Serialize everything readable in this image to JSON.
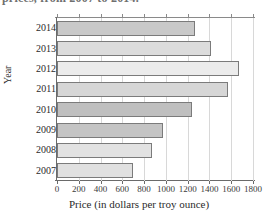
{
  "title": "prices, from 2007 to 2014.",
  "chart_data": {
    "type": "bar",
    "orientation": "horizontal",
    "title": "prices, from 2007 to 2014.",
    "xlabel": "Price (in dollars per troy ounce)",
    "ylabel": "Year",
    "categories": [
      "2014",
      "2013",
      "2012",
      "2011",
      "2010",
      "2009",
      "2008",
      "2007"
    ],
    "values": [
      1270,
      1410,
      1670,
      1570,
      1240,
      970,
      870,
      700
    ],
    "xlim": [
      0,
      1800
    ],
    "xticks": [
      0,
      200,
      400,
      600,
      800,
      1000,
      1200,
      1400,
      1600,
      1800
    ],
    "xtick_labels": [
      "0",
      "200",
      "400",
      "600",
      "800",
      "1000",
      "1200",
      "1400",
      "1600",
      "1800"
    ],
    "grid": true,
    "legend": "none",
    "bar_fills": [
      "#c9c9c9",
      "#dcdcdc",
      "#ececec",
      "#d6d6d6",
      "#bfbfbf",
      "#c4c4c4",
      "#e2e2e2",
      "#e0e0e0"
    ],
    "bar_edge_color": "#7b7b7b",
    "gridline_color": "#d8d8d8",
    "axis_color": "#6a6a6a"
  }
}
